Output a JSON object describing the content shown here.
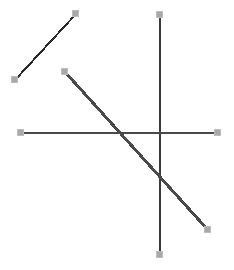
{
  "canvas": {
    "width": 234,
    "height": 270,
    "background_color": "#ffffff",
    "title": "line-segment-drawing-canvas"
  },
  "style": {
    "handle_fill": "#a8a8a8",
    "handle_stroke": "#bdbdbd",
    "handle_size": 7
  },
  "chart_data": {
    "type": "scatter",
    "title": "",
    "xlabel": "",
    "ylabel": "",
    "xlim": [
      0,
      234
    ],
    "ylim": [
      0,
      270
    ],
    "grid": false,
    "legend": "none",
    "series": [
      {
        "name": "segment-upper-left-diagonal",
        "color": "#2b2b2b",
        "width": 2,
        "x": [
          15,
          76
        ],
        "y": [
          80,
          14
        ]
      },
      {
        "name": "segment-vertical",
        "color": "#3a3a3a",
        "width": 2,
        "x": [
          160,
          160
        ],
        "y": [
          15,
          255
        ]
      },
      {
        "name": "segment-horizontal",
        "color": "#4a4a4a",
        "width": 2,
        "x": [
          21,
          218
        ],
        "y": [
          133,
          133
        ]
      },
      {
        "name": "segment-main-diagonal",
        "color": "#4a4a4a",
        "width": 3,
        "x": [
          65,
          208
        ],
        "y": [
          72,
          230
        ]
      }
    ]
  },
  "handles": [
    {
      "name": "handle-seg1-start",
      "x": 15,
      "y": 80
    },
    {
      "name": "handle-seg1-end",
      "x": 76,
      "y": 14
    },
    {
      "name": "handle-seg2-start",
      "x": 160,
      "y": 15
    },
    {
      "name": "handle-seg2-end",
      "x": 160,
      "y": 255
    },
    {
      "name": "handle-seg3-start",
      "x": 21,
      "y": 133
    },
    {
      "name": "handle-seg3-end",
      "x": 218,
      "y": 133
    },
    {
      "name": "handle-seg4-start",
      "x": 65,
      "y": 72
    },
    {
      "name": "handle-seg4-end",
      "x": 208,
      "y": 230
    }
  ]
}
